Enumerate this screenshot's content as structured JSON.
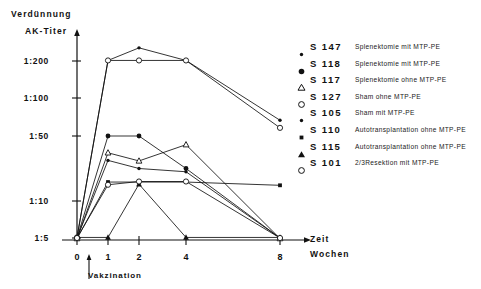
{
  "axes": {
    "y_title_top": "Verdünnung",
    "y_title": "AK-Titer",
    "x_title_line1": "Zeit",
    "x_title_line2": "Wochen",
    "vaccination_annotation": "Vakzination",
    "y_ticks": [
      "1:200",
      "1:100",
      "1:50",
      "1:10",
      "1:5"
    ],
    "x_ticks": [
      "0",
      "1",
      "2",
      "4",
      "8"
    ]
  },
  "legend": {
    "items": [
      {
        "marker": "small-filled-dot",
        "code": "S 147",
        "description": "Splenektomie mit MTP-PE"
      },
      {
        "marker": "filled-dot",
        "code": "S 118",
        "description": "Splenektomie mit MTP-PE"
      },
      {
        "marker": "open-triangle",
        "code": "S 117",
        "description": "Splenektomie ohne MTP-PE"
      },
      {
        "marker": "open-circle",
        "code": "S 127",
        "description": "Sham ohne MTP-PE"
      },
      {
        "marker": "small-filled-dot",
        "code": "S 105",
        "description": "Sham mit MTP-PE"
      },
      {
        "marker": "small-filled-square",
        "code": "S 110",
        "description": "Autotransplantation ohne MTP-PE"
      },
      {
        "marker": "filled-triangle",
        "code": "S 115",
        "description": "Autotransplantation ohne MTP-PE"
      },
      {
        "marker": "open-circle",
        "code": "S 101",
        "description": "2/3Resektion mit MTP-PE"
      }
    ]
  },
  "chart_data": {
    "type": "line",
    "title": "",
    "xlabel": "Zeit Wochen",
    "ylabel": "AK-Titer (Verdünnung)",
    "x": [
      0,
      1,
      2,
      4,
      8
    ],
    "x_tick_labels": [
      "0",
      "1",
      "2",
      "4",
      "8"
    ],
    "y_tick_labels": [
      "1:5",
      "1:10",
      "1:50",
      "1:100",
      "1:200"
    ],
    "y_tick_values": [
      5,
      10,
      50,
      100,
      200
    ],
    "y_scale": "ordinal-log-like",
    "grid": false,
    "legend_position": "right",
    "series": [
      {
        "name": "S 147",
        "marker": "small-filled-dot",
        "values": [
          5,
          200,
          260,
          200,
          70
        ],
        "value_labels": [
          "1:5",
          "1:200",
          "1:260",
          "1:200",
          "1:70"
        ]
      },
      {
        "name": "S 118",
        "marker": "filled-dot",
        "values": [
          5,
          50,
          50,
          30,
          5
        ],
        "value_labels": [
          "1:5",
          "1:50",
          "1:50",
          "1:30",
          "1:5"
        ]
      },
      {
        "name": "S 117",
        "marker": "open-triangle",
        "values": [
          5,
          40,
          35,
          45,
          5
        ],
        "value_labels": [
          "1:5",
          "1:40",
          "1:35",
          "1:45",
          "1:5"
        ]
      },
      {
        "name": "S 127",
        "marker": "open-circle",
        "values": [
          5,
          200,
          200,
          200,
          60
        ],
        "value_labels": [
          "1:5",
          "1:200",
          "1:200",
          "1:200",
          "1:60"
        ]
      },
      {
        "name": "S 105",
        "marker": "small-filled-dot",
        "values": [
          5,
          35,
          30,
          28,
          5
        ],
        "value_labels": [
          "1:5",
          "1:35",
          "1:30",
          "1:28",
          "1:5"
        ]
      },
      {
        "name": "S 110",
        "marker": "small-filled-square",
        "values": [
          5,
          22,
          22,
          22,
          20
        ],
        "value_labels": [
          "1:5",
          "1:22",
          "1:22",
          "1:22",
          "1:20"
        ]
      },
      {
        "name": "S 115",
        "marker": "filled-triangle",
        "values": [
          5,
          5,
          20,
          5,
          5
        ],
        "value_labels": [
          "1:5",
          "1:5",
          "1:20",
          "1:5",
          "1:5"
        ]
      },
      {
        "name": "S 101",
        "marker": "open-circle",
        "values": [
          5,
          20,
          22,
          22,
          5
        ],
        "value_labels": [
          "1:5",
          "1:20",
          "1:22",
          "1:22",
          "1:5"
        ]
      }
    ]
  }
}
